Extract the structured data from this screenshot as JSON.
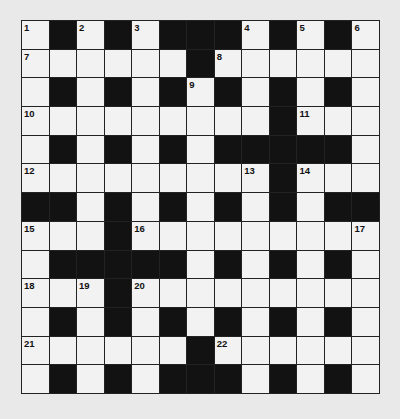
{
  "puzzle": {
    "type": "crossword",
    "rows": 13,
    "cols": 13,
    "grid": [
      "W.W.W...W.W.W",
      "WWWWWW.WWWWWW",
      "W.W.W.W.W.W.W",
      "WWWWWWWWW.WWW",
      "W.W.W.W.....W",
      "WWWWWWWWW.WWW",
      "..W.W.W.W.W..",
      "WWW.WWWWWWWWW",
      "W.....W.W.W.W",
      "WWW.WWWWWWWWW",
      "W.W.W.W.W.W.W",
      "WWWWWW.WWWWWW",
      "W.W.W...W.W.W"
    ],
    "numbers": [
      {
        "row": 0,
        "col": 0,
        "n": "1"
      },
      {
        "row": 0,
        "col": 2,
        "n": "2"
      },
      {
        "row": 0,
        "col": 4,
        "n": "3"
      },
      {
        "row": 0,
        "col": 8,
        "n": "4"
      },
      {
        "row": 0,
        "col": 10,
        "n": "5"
      },
      {
        "row": 0,
        "col": 12,
        "n": "6"
      },
      {
        "row": 1,
        "col": 0,
        "n": "7"
      },
      {
        "row": 1,
        "col": 7,
        "n": "8"
      },
      {
        "row": 2,
        "col": 6,
        "n": "9"
      },
      {
        "row": 3,
        "col": 0,
        "n": "10"
      },
      {
        "row": 3,
        "col": 10,
        "n": "11"
      },
      {
        "row": 5,
        "col": 0,
        "n": "12"
      },
      {
        "row": 5,
        "col": 8,
        "n": "13"
      },
      {
        "row": 5,
        "col": 10,
        "n": "14"
      },
      {
        "row": 7,
        "col": 0,
        "n": "15"
      },
      {
        "row": 7,
        "col": 4,
        "n": "16"
      },
      {
        "row": 7,
        "col": 12,
        "n": "17"
      },
      {
        "row": 9,
        "col": 0,
        "n": "18"
      },
      {
        "row": 9,
        "col": 2,
        "n": "19"
      },
      {
        "row": 9,
        "col": 4,
        "n": "20"
      },
      {
        "row": 11,
        "col": 0,
        "n": "21"
      },
      {
        "row": 11,
        "col": 7,
        "n": "22"
      }
    ],
    "colors": {
      "paper": "#e9e9e9",
      "white_cell": "#f2f2f2",
      "black_cell": "#121212",
      "grid_line": "#222222"
    }
  }
}
